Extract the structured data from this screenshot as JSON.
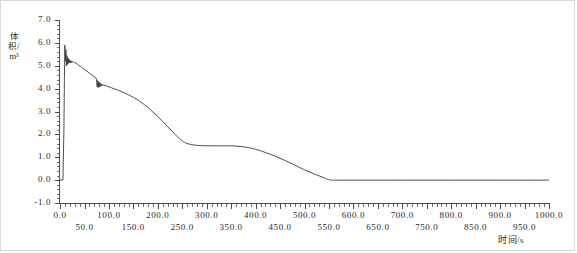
{
  "chart_data": {
    "type": "line",
    "title": "",
    "xlabel": "时间/s",
    "ylabel": "体积/m³",
    "xlim": [
      0,
      1000
    ],
    "ylim": [
      -1.0,
      7.0
    ],
    "grid": false,
    "legend": null,
    "x_major_step": 50,
    "x_minor_step": 10,
    "y_major_step": 1.0,
    "y_minor_step": 0.2,
    "xticks": [
      "0.0",
      "50.0",
      "100.0",
      "150.0",
      "200.0",
      "250.0",
      "300.0",
      "350.0",
      "400.0",
      "450.0",
      "500.0",
      "550.0",
      "600.0",
      "650.0",
      "700.0",
      "750.0",
      "800.0",
      "850.0",
      "900.0",
      "950.0",
      "1000.0"
    ],
    "yticks": [
      "-1.0",
      "0.0",
      "1.0",
      "2.0",
      "3.0",
      "4.0",
      "5.0",
      "6.0",
      "7.0"
    ],
    "series": [
      {
        "name": "体积",
        "color": "#3b3b3b",
        "x": [
          0,
          6,
          8,
          9,
          10,
          11,
          12,
          13,
          14,
          15,
          16,
          17,
          18,
          19,
          20,
          21,
          22,
          23,
          24,
          25,
          26,
          27,
          28,
          30,
          32,
          35,
          38,
          42,
          46,
          50,
          55,
          60,
          65,
          70,
          72,
          74,
          75,
          76,
          77,
          78,
          79,
          80,
          81,
          82,
          83,
          84,
          85,
          86,
          88,
          90,
          95,
          100,
          110,
          120,
          130,
          140,
          150,
          160,
          170,
          180,
          190,
          200,
          210,
          220,
          230,
          240,
          250,
          260,
          280,
          300,
          320,
          340,
          350,
          360,
          370,
          380,
          390,
          400,
          420,
          440,
          460,
          480,
          500,
          520,
          540,
          550,
          560,
          600,
          700,
          800,
          900,
          1000
        ],
        "y": [
          0.0,
          0.0,
          2.2,
          4.4,
          5.9,
          5.2,
          5.7,
          5.0,
          5.45,
          5.05,
          5.35,
          5.1,
          5.3,
          5.12,
          5.25,
          5.13,
          5.22,
          5.14,
          5.2,
          5.15,
          5.18,
          5.15,
          5.17,
          5.14,
          5.12,
          5.08,
          5.03,
          4.97,
          4.9,
          4.84,
          4.76,
          4.68,
          4.6,
          4.52,
          4.49,
          4.46,
          4.3,
          4.08,
          4.35,
          4.05,
          4.3,
          4.06,
          4.26,
          4.09,
          4.23,
          4.12,
          4.2,
          4.14,
          4.17,
          4.15,
          4.12,
          4.08,
          4.0,
          3.92,
          3.83,
          3.73,
          3.62,
          3.49,
          3.34,
          3.17,
          2.98,
          2.78,
          2.56,
          2.34,
          2.12,
          1.9,
          1.72,
          1.6,
          1.52,
          1.5,
          1.5,
          1.5,
          1.5,
          1.49,
          1.47,
          1.44,
          1.4,
          1.35,
          1.21,
          1.05,
          0.86,
          0.66,
          0.45,
          0.27,
          0.1,
          0.02,
          0.0,
          0.0,
          0.0,
          0.0,
          0.0,
          0.0
        ]
      }
    ]
  }
}
